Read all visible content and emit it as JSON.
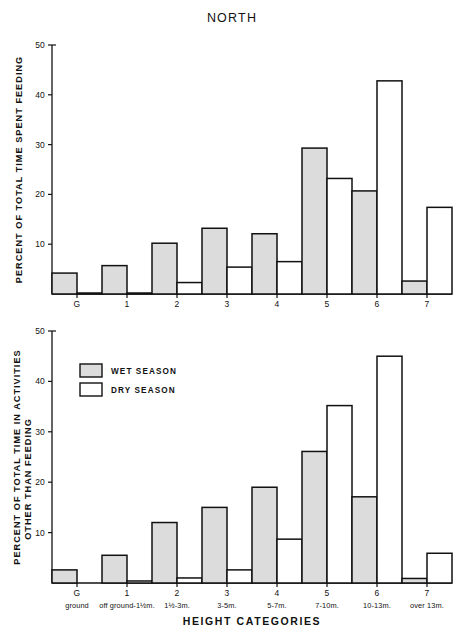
{
  "figure": {
    "title": "NORTH",
    "xaxis_title": "HEIGHT CATEGORIES",
    "legend": {
      "wet_label": "WET SEASON",
      "dry_label": "DRY SEASON",
      "wet_color": "#dcdcdc",
      "dry_color": "#ffffff",
      "border_color": "#111111"
    }
  },
  "chart_data": [
    {
      "type": "bar",
      "title": "NORTH",
      "panel": "top",
      "ylabel": "PERCENT OF TOTAL TIME SPENT FEEDING",
      "xlabel": "",
      "ylim": [
        0,
        50
      ],
      "yticks": [
        0,
        10,
        20,
        30,
        40,
        50
      ],
      "ytick_labels": [
        "",
        "10",
        "20",
        "30",
        "40",
        "50"
      ],
      "grid": false,
      "legend_position": "none",
      "categories": [
        "G",
        "1",
        "2",
        "3",
        "4",
        "5",
        "6",
        "7"
      ],
      "category_sublabels": [
        "ground",
        "off ground-1½m.",
        "1½-3m.",
        "3-5m.",
        "5-7m.",
        "7-10m.",
        "10-13m.",
        "over 13m."
      ],
      "series": [
        {
          "name": "WET SEASON",
          "values": [
            4.2,
            5.7,
            10.2,
            13.2,
            12.1,
            29.3,
            20.7,
            2.6
          ]
        },
        {
          "name": "DRY SEASON",
          "values": [
            0.2,
            0.2,
            2.3,
            5.4,
            6.5,
            23.2,
            42.8,
            17.4
          ]
        }
      ]
    },
    {
      "type": "bar",
      "panel": "bottom",
      "ylabel": "PERCENT OF TOTAL TIME IN ACTIVITIES OTHER THAN FEEDING",
      "ylabel_line1": "PERCENT OF TOTAL TIME IN ACTIVITIES",
      "ylabel_line2": "OTHER THAN FEEDING",
      "xlabel": "HEIGHT CATEGORIES",
      "ylim": [
        0,
        50
      ],
      "yticks": [
        0,
        10,
        20,
        30,
        40,
        50
      ],
      "ytick_labels": [
        "",
        "10",
        "20",
        "30",
        "40",
        "50"
      ],
      "grid": false,
      "legend_position": "upper left",
      "categories": [
        "G",
        "1",
        "2",
        "3",
        "4",
        "5",
        "6",
        "7"
      ],
      "category_sublabels": [
        "ground",
        "off ground-1½m.",
        "1½-3m.",
        "3-5m.",
        "5-7m.",
        "7-10m.",
        "10-13m.",
        "over 13m."
      ],
      "series": [
        {
          "name": "WET SEASON",
          "values": [
            2.6,
            5.5,
            12.0,
            15.0,
            19.0,
            26.1,
            17.1,
            0.9
          ]
        },
        {
          "name": "DRY SEASON",
          "values": [
            0.0,
            0.4,
            1.0,
            2.6,
            8.7,
            35.2,
            45.0,
            5.9
          ]
        }
      ]
    }
  ],
  "ylabel_top": "PERCENT OF TOTAL TIME SPENT FEEDING",
  "ylabel_bottom_line1": "PERCENT OF TOTAL TIME IN ACTIVITIES",
  "ylabel_bottom_line2": "OTHER THAN FEEDING"
}
